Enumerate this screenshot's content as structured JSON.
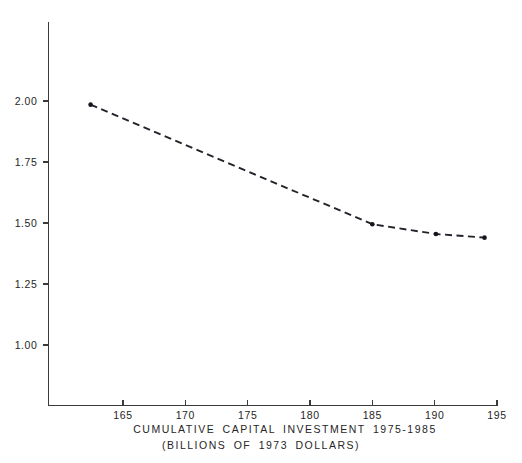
{
  "chart_data": {
    "type": "line",
    "title": "",
    "xlabel": "CUMULATIVE  CAPITAL  INVESTMENT  1975-1985",
    "xlabel_line2": "(BILLIONS  OF  1973  DOLLARS)",
    "ylabel": "",
    "xlim": [
      162,
      196
    ],
    "ylim": [
      0.93,
      2.22
    ],
    "grid": false,
    "legend": false,
    "x_ticks": [
      165,
      170,
      175,
      180,
      185,
      190,
      195
    ],
    "x_tick_labels": [
      "165",
      "170",
      "175",
      "180",
      "185",
      "190",
      "195"
    ],
    "y_ticks": [
      1.0,
      1.25,
      1.5,
      1.75,
      2.0
    ],
    "y_tick_labels": [
      "1.00",
      "1.25",
      "1.50",
      "1.75",
      "2.00"
    ],
    "series": [
      {
        "name": "cost",
        "linestyle": "dashed",
        "marker": "dot",
        "x": [
          162.4,
          185.0,
          190.1,
          194.0
        ],
        "y": [
          1.985,
          1.495,
          1.455,
          1.44
        ]
      }
    ]
  },
  "axis_labels": {
    "x_title_line1": "CUMULATIVE  CAPITAL  INVESTMENT  1975-1985",
    "x_title_line2": "(BILLIONS  OF  1973  DOLLARS)"
  },
  "colors": {
    "background": "#ffffff",
    "axis": "#3a3a3a",
    "line": "#22222a",
    "marker": "#15151c",
    "text": "#262626"
  }
}
